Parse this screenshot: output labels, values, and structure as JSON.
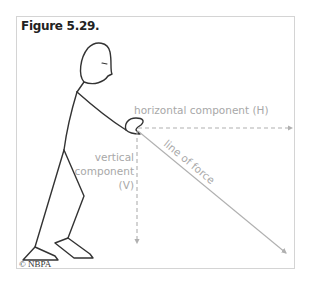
{
  "figure": {
    "title": "Figure 5.29.",
    "copyright": "© NBPA",
    "labels": {
      "horizontal": "horizontal component (H)",
      "vertical_line1": "vertical",
      "vertical_line2": "component",
      "vertical_line3": "(V)",
      "line_of_force": "line of force"
    },
    "colors": {
      "figure_stroke": "#333333",
      "vector_stroke": "#b0b0b0",
      "label_text": "#a8a8a8",
      "frame_border": "#d4d4d4"
    }
  }
}
